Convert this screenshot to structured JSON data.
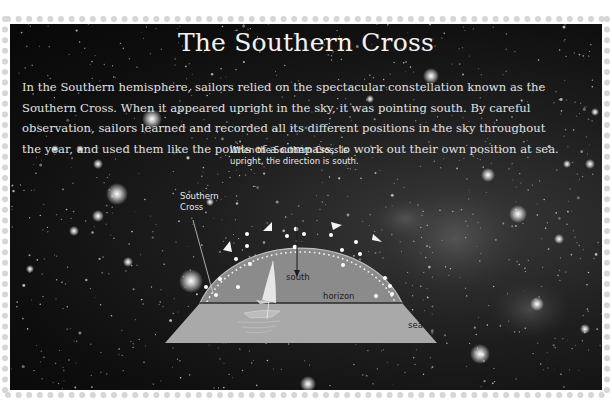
{
  "title": "The Southern Cross",
  "intro_lines": [
    "In the Southern hemisphere, sailors relied on the spectacular constellation known as the",
    "Southern Cross. When it appeared upright in the sky, it was pointing south. By careful",
    "observation, sailors learned and recorded all its different positions in the sky throughout",
    "the year, and used them like the points of a compass, to work out their own position at sea."
  ],
  "diagram": {
    "callout_upright": [
      "When the Southern Cross is",
      "upright, the direction is south."
    ],
    "callout_southern_cross": [
      "Southern",
      "Cross"
    ],
    "label_south": "south",
    "label_horizon": "horizon",
    "label_sea": "sea"
  },
  "colors": {
    "sky_dark": "#0e0e0e",
    "dome_fill": "#8c8c8c",
    "sea_fill": "#a8a8a8",
    "text_light": "#eeeeee",
    "perforation": "#d4d4d4"
  }
}
